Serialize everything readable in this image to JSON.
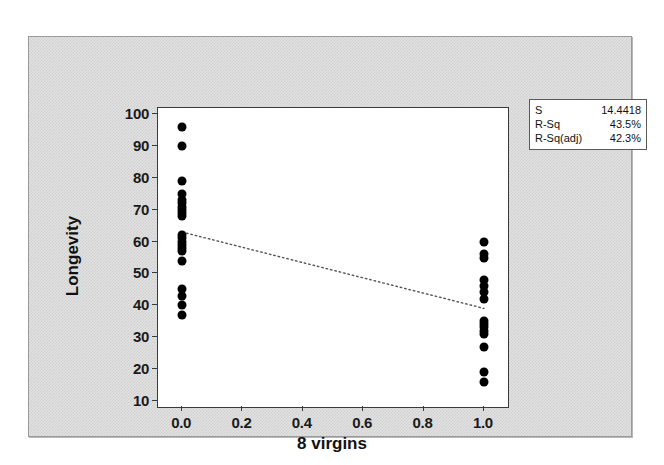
{
  "chart_data": {
    "type": "scatter",
    "title": "",
    "xlabel": "8 virgins",
    "ylabel": "Longevity",
    "xlim": [
      -0.08,
      1.08
    ],
    "ylim": [
      8,
      102
    ],
    "xticks": [
      "0.0",
      "0.2",
      "0.4",
      "0.6",
      "0.8",
      "1.0"
    ],
    "xtick_values": [
      0.0,
      0.2,
      0.4,
      0.6,
      0.8,
      1.0
    ],
    "yticks": [
      "10",
      "20",
      "30",
      "40",
      "50",
      "60",
      "70",
      "80",
      "90",
      "100"
    ],
    "ytick_values": [
      10,
      20,
      30,
      40,
      50,
      60,
      70,
      80,
      90,
      100
    ],
    "grid": false,
    "legend": "none",
    "series": [
      {
        "name": "Longevity observations",
        "marker": "filled-circle",
        "color": "#000000",
        "points": [
          {
            "x": 0,
            "y": 96
          },
          {
            "x": 0,
            "y": 90
          },
          {
            "x": 0,
            "y": 79
          },
          {
            "x": 0,
            "y": 75
          },
          {
            "x": 0,
            "y": 73
          },
          {
            "x": 0,
            "y": 72
          },
          {
            "x": 0,
            "y": 71
          },
          {
            "x": 0,
            "y": 70
          },
          {
            "x": 0,
            "y": 69
          },
          {
            "x": 0,
            "y": 68
          },
          {
            "x": 0,
            "y": 62
          },
          {
            "x": 0,
            "y": 61
          },
          {
            "x": 0,
            "y": 60
          },
          {
            "x": 0,
            "y": 59
          },
          {
            "x": 0,
            "y": 58
          },
          {
            "x": 0,
            "y": 57
          },
          {
            "x": 0,
            "y": 54
          },
          {
            "x": 0,
            "y": 45
          },
          {
            "x": 0,
            "y": 43
          },
          {
            "x": 0,
            "y": 40
          },
          {
            "x": 0,
            "y": 37
          },
          {
            "x": 1,
            "y": 60
          },
          {
            "x": 1,
            "y": 56
          },
          {
            "x": 1,
            "y": 55
          },
          {
            "x": 1,
            "y": 48
          },
          {
            "x": 1,
            "y": 46
          },
          {
            "x": 1,
            "y": 44
          },
          {
            "x": 1,
            "y": 42
          },
          {
            "x": 1,
            "y": 35
          },
          {
            "x": 1,
            "y": 34
          },
          {
            "x": 1,
            "y": 33
          },
          {
            "x": 1,
            "y": 32
          },
          {
            "x": 1,
            "y": 31
          },
          {
            "x": 1,
            "y": 27
          },
          {
            "x": 1,
            "y": 19
          },
          {
            "x": 1,
            "y": 16
          }
        ]
      }
    ],
    "fit_line": {
      "style": "dotted",
      "color": "#555555",
      "x_start": 0,
      "y_start": 63,
      "x_end": 1,
      "y_end": 39
    }
  },
  "statbox": {
    "rows": [
      {
        "key": "S",
        "value": "14.4418"
      },
      {
        "key": "R-Sq",
        "value": "43.5%"
      },
      {
        "key": "R-Sq(adj)",
        "value": "42.3%"
      }
    ]
  }
}
